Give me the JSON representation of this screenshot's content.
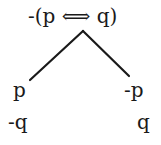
{
  "tree": {
    "root": {
      "formula": "-(p ⟺ q)"
    },
    "branches": [
      {
        "side": "left",
        "lines": [
          "p",
          "-q"
        ]
      },
      {
        "side": "right",
        "lines": [
          "-p",
          "q"
        ]
      }
    ],
    "colors": {
      "text": "#1a1a1a",
      "lines": "#1a1a1a",
      "background": "#ffffff"
    }
  }
}
